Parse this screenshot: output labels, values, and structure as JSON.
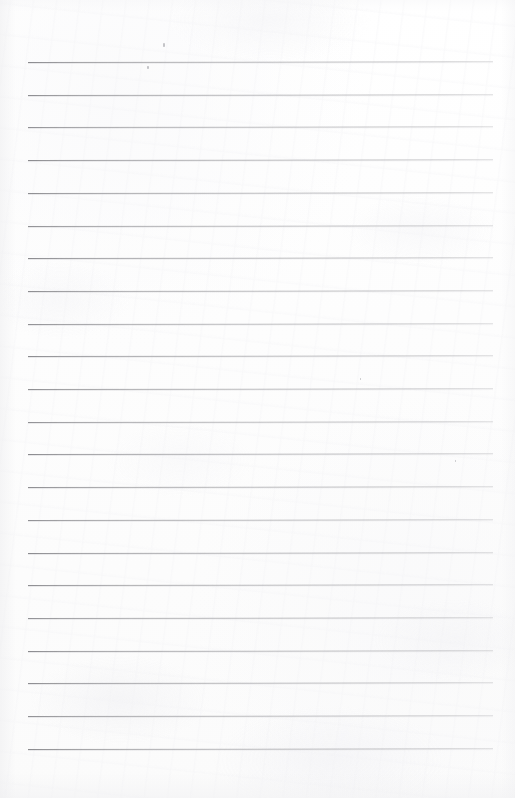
{
  "document": {
    "kind": "scanned-lined-notebook-page",
    "title": "Blank ruled notebook page",
    "page_width": 515,
    "page_height": 798,
    "body_text": "",
    "visible_text": "",
    "has_handwriting": false,
    "has_printed_text": false
  },
  "paper": {
    "background_color": "#fefefe",
    "texture": "subtle scan grain with light mottling",
    "edge_shadow_color": "#eeeef0"
  },
  "ruling": {
    "style": "horizontal ruled lines",
    "line_color": "#8a8a8e",
    "line_thickness_px": 1,
    "line_start_x": 28,
    "line_end_x": 493,
    "line_spacing_px": 32.7,
    "first_line_y": 62,
    "last_line_y": 749,
    "line_count": 22,
    "line_y_positions": [
      62,
      94.7,
      127.4,
      160.1,
      192.8,
      225.5,
      258.2,
      290.9,
      323.6,
      356.3,
      389,
      421.7,
      454.4,
      487.1,
      519.8,
      552.5,
      585.2,
      617.9,
      650.6,
      683.3,
      716,
      748.7
    ]
  },
  "artifacts": {
    "specks": [
      {
        "x": 163,
        "y": 43,
        "w": 1.6,
        "h": 4
      },
      {
        "x": 147,
        "y": 66,
        "w": 1.6,
        "h": 3
      },
      {
        "x": 455,
        "y": 460,
        "w": 1.4,
        "h": 2
      },
      {
        "x": 360,
        "y": 378,
        "w": 1.2,
        "h": 2
      }
    ]
  }
}
